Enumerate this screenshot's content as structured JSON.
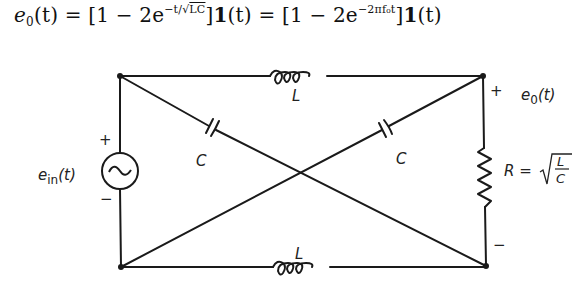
{
  "equation": {
    "lhs": "e",
    "lhs_sub": "0",
    "lhs_arg": "(t)",
    "eq1": " = [1 − 2e",
    "exp1_prefix": "−t/√",
    "exp1_sqrt": "LC",
    "mid": "]",
    "step": "1",
    "arg": "(t)",
    "eq2": " = [1 − 2e",
    "exp2": "−2πf₀t",
    "end": "]",
    "step2": "1",
    "arg2": "(t)"
  },
  "circuit": {
    "source": {
      "label": "e",
      "label_sub": "in",
      "label_arg": "(t)",
      "plus": "+",
      "minus": "−",
      "symbol": "ac-source"
    },
    "top_inductor": {
      "label": "L"
    },
    "bottom_inductor": {
      "label": "L"
    },
    "left_capacitor": {
      "label": "C"
    },
    "right_capacitor": {
      "label": "C"
    },
    "resistor": {
      "label": "R = ",
      "sqrt_num": "L",
      "sqrt_den": "C"
    },
    "output": {
      "label": "e",
      "label_sub": "0",
      "label_arg": "(t)",
      "plus": "+",
      "minus": "−"
    }
  },
  "colors": {
    "line": "#1a1a1a",
    "background": "#ffffff"
  }
}
